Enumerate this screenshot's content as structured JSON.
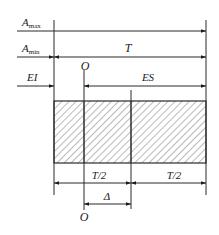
{
  "diagram": {
    "type": "tolerance-zone-dimension-diagram",
    "labels": {
      "a_max": "A",
      "a_max_sub": "max",
      "a_min": "A",
      "a_min_sub": "min",
      "t": "T",
      "ei": "EI",
      "es": "ES",
      "o_top": "O",
      "half_t_left": "T/2",
      "half_t_right": "T/2",
      "delta": "Δ",
      "o_bottom": "O"
    },
    "colors": {
      "line": "#2a2a2a",
      "text": "#1a1a1a",
      "hatch": "#3a3a3a",
      "background": "#ffffff"
    }
  }
}
